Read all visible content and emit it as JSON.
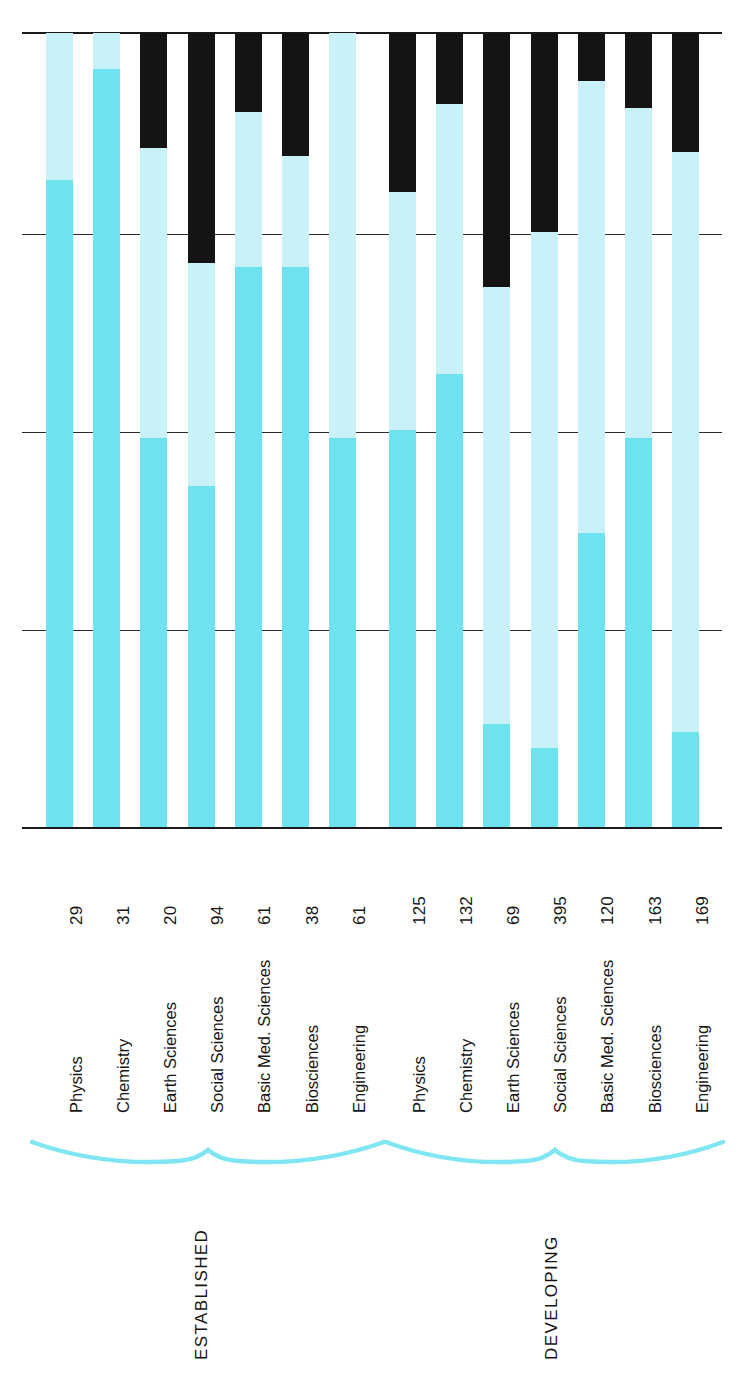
{
  "chart_data": {
    "type": "bar",
    "title": "",
    "subtitle": "",
    "xlabel": "",
    "ylabel": "",
    "orientation": "vertical-bars-rotated-labels",
    "grid": true,
    "gridlines": 3,
    "legend": "none",
    "groups": [
      {
        "name": "ESTABLISHED",
        "categories": [
          "Physics",
          "Chemistry",
          "Earth Sciences",
          "Social Sciences",
          "Basic Med. Sciences",
          "Biosciences",
          "Engineering"
        ],
        "values": [
          29,
          31,
          20,
          94,
          61,
          38,
          61
        ],
        "fill_fraction": [
          0.815,
          0.955,
          0.49,
          0.43,
          0.705,
          0.705,
          0.49
        ],
        "cap_fraction": [
          0.0,
          0.0,
          0.145,
          0.29,
          0.1,
          0.155,
          0.0
        ]
      },
      {
        "name": "DEVELOPING",
        "categories": [
          "Physics",
          "Chemistry",
          "Earth Sciences",
          "Social Sciences",
          "Basic Med. Sciences",
          "Biosciences",
          "Engineering"
        ],
        "values": [
          125,
          132,
          69,
          395,
          120,
          163,
          169
        ],
        "fill_fraction": [
          0.5,
          0.57,
          0.13,
          0.1,
          0.37,
          0.49,
          0.12
        ],
        "cap_fraction": [
          0.2,
          0.09,
          0.32,
          0.25,
          0.06,
          0.095,
          0.15
        ]
      }
    ],
    "all_categories": [
      "Physics",
      "Chemistry",
      "Earth Sciences",
      "Social Sciences",
      "Basic Med. Sciences",
      "Biosciences",
      "Engineering",
      "Physics",
      "Chemistry",
      "Earth Sciences",
      "Social Sciences",
      "Basic Med. Sciences",
      "Biosciences",
      "Engineering"
    ],
    "all_values": [
      29,
      31,
      20,
      94,
      61,
      38,
      61,
      125,
      132,
      69,
      395,
      120,
      163,
      169
    ],
    "colors": {
      "track": "#c9f2f8",
      "fill": "#6fe2ef",
      "cap": "#141414",
      "axis": "#1a1a1a",
      "brace": "#7fe6f2",
      "text": "#141414",
      "background": "#ffffff"
    }
  },
  "bars": [
    {
      "label": "Physics",
      "value": "29",
      "group": "ESTABLISHED",
      "fill": 0.815,
      "cap": 0.0
    },
    {
      "label": "Chemistry",
      "value": "31",
      "group": "ESTABLISHED",
      "fill": 0.955,
      "cap": 0.0
    },
    {
      "label": "Earth Sciences",
      "value": "20",
      "group": "ESTABLISHED",
      "fill": 0.49,
      "cap": 0.145
    },
    {
      "label": "Social Sciences",
      "value": "94",
      "group": "ESTABLISHED",
      "fill": 0.43,
      "cap": 0.29
    },
    {
      "label": "Basic Med. Sciences",
      "value": "61",
      "group": "ESTABLISHED",
      "fill": 0.705,
      "cap": 0.1
    },
    {
      "label": "Biosciences",
      "value": "38",
      "group": "ESTABLISHED",
      "fill": 0.705,
      "cap": 0.155
    },
    {
      "label": "Engineering",
      "value": "61",
      "group": "ESTABLISHED",
      "fill": 0.49,
      "cap": 0.0
    },
    {
      "label": "Physics",
      "value": "125",
      "group": "DEVELOPING",
      "fill": 0.5,
      "cap": 0.2
    },
    {
      "label": "Chemistry",
      "value": "132",
      "group": "DEVELOPING",
      "fill": 0.57,
      "cap": 0.09
    },
    {
      "label": "Earth Sciences",
      "value": "69",
      "group": "DEVELOPING",
      "fill": 0.13,
      "cap": 0.32
    },
    {
      "label": "Social Sciences",
      "value": "395",
      "group": "DEVELOPING",
      "fill": 0.1,
      "cap": 0.25
    },
    {
      "label": "Basic Med. Sciences",
      "value": "120",
      "group": "DEVELOPING",
      "fill": 0.37,
      "cap": 0.06
    },
    {
      "label": "Biosciences",
      "value": "163",
      "group": "DEVELOPING",
      "fill": 0.49,
      "cap": 0.095
    },
    {
      "label": "Engineering",
      "value": "169",
      "group": "DEVELOPING",
      "fill": 0.12,
      "cap": 0.15
    }
  ],
  "groups": [
    {
      "name": "ESTABLISHED"
    },
    {
      "name": "DEVELOPING"
    }
  ]
}
